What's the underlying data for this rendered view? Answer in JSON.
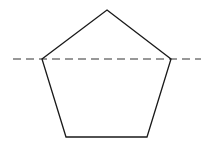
{
  "figure": {
    "pentagon": {
      "vertices": [
        [
          107,
          10
        ],
        [
          171,
          59
        ],
        [
          147,
          137
        ],
        [
          66,
          137
        ],
        [
          42,
          59
        ]
      ],
      "stroke": "#1a1a1a",
      "fill": "none"
    },
    "dashed_line": {
      "x1": 13,
      "y1": 59,
      "x2": 201,
      "y2": 59,
      "stroke": "#333333",
      "dash": "8,5"
    }
  }
}
